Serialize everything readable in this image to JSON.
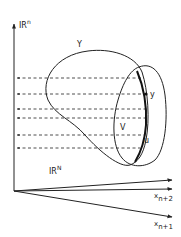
{
  "diagram": {
    "labels": {
      "vertical_axis": "IR",
      "vertical_axis_sup": "n",
      "base_space": "IR",
      "base_space_sup": "N",
      "set_Y": "Y",
      "set_V": "V",
      "point_y": "y",
      "point_u": "u",
      "axis_x_n2": "x",
      "axis_x_n2_sub": "n+2",
      "axis_x_n1": "x",
      "axis_x_n1_sub": "n+1"
    },
    "projection_lines_y": [
      78,
      94,
      109,
      118,
      135,
      148
    ],
    "colors": {
      "stroke": "#222222",
      "background": "#ffffff"
    }
  }
}
